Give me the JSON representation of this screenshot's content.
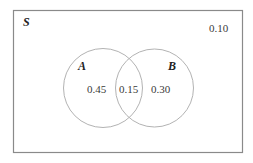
{
  "diagram": {
    "type": "venn",
    "universe": {
      "label": "S",
      "outside_value": "0.10"
    },
    "sets": [
      {
        "label": "A",
        "only_value": "0.45"
      },
      {
        "label": "B",
        "only_value": "0.30"
      }
    ],
    "intersection_value": "0.15",
    "colors": {
      "border": "#8a8a8a",
      "circle": "#b0b0b0",
      "text": "#3a3a3a"
    }
  }
}
